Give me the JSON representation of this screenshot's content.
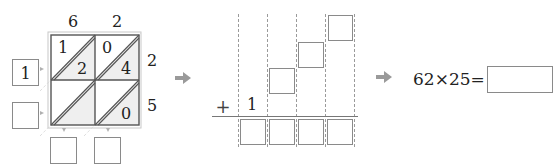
{
  "lattice": {
    "top_digits": [
      "6",
      "2"
    ],
    "right_digits": [
      "2",
      "5"
    ],
    "cells": [
      {
        "row": 0,
        "col": 0,
        "tens": "1",
        "ones": "2"
      },
      {
        "row": 0,
        "col": 1,
        "tens": "0",
        "ones": "4"
      },
      {
        "row": 1,
        "col": 0,
        "tens": "",
        "ones": ""
      },
      {
        "row": 1,
        "col": 1,
        "tens": "",
        "ones": "0"
      }
    ],
    "left_boxes": [
      "1",
      ""
    ],
    "bottom_boxes": [
      "",
      ""
    ]
  },
  "addition": {
    "plus_sign": "+",
    "carry": "1",
    "staircase_boxes": [
      "",
      "",
      ""
    ],
    "result_boxes": [
      "",
      "",
      "",
      ""
    ]
  },
  "equation": {
    "expression": "62×25=",
    "answer": ""
  },
  "colors": {
    "line": "#555555",
    "box_border": "#8a8a8a",
    "arrow": "#9a9a9a",
    "shade": "#eeeeee"
  }
}
